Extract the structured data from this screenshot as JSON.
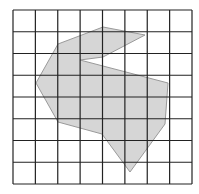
{
  "diagram": {
    "type": "grid-polygon",
    "grid": {
      "cols": 8,
      "rows": 8,
      "left": 13,
      "top": 10,
      "right": 192,
      "bottom": 184,
      "line_color": "#222222",
      "line_width": 1.2
    },
    "polygon": {
      "fill": "#d6d6d6",
      "stroke": "#9a9a9a",
      "points": [
        [
          103,
          27
        ],
        [
          145,
          35
        ],
        [
          103,
          57
        ],
        [
          80,
          60
        ],
        [
          168,
          83
        ],
        [
          165,
          124
        ],
        [
          130,
          172
        ],
        [
          102,
          134
        ],
        [
          58,
          122
        ],
        [
          36,
          83
        ],
        [
          58,
          44
        ]
      ]
    }
  }
}
